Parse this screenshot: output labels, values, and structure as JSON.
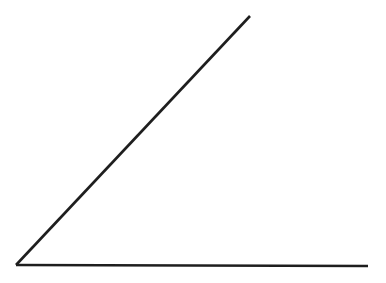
{
  "canvas": {
    "width": 386,
    "height": 283,
    "background_color": "#ffffff"
  },
  "figure": {
    "kind": "angle",
    "stroke_color": "#1e1e1e",
    "stroke_width": 2.6,
    "vertex": {
      "x": 16,
      "y": 265
    },
    "angle_degrees": 47,
    "rays": [
      {
        "name": "horizontal-ray",
        "from": {
          "x": 16,
          "y": 265
        },
        "to": {
          "x": 368,
          "y": 266
        },
        "orientation": "horizontal",
        "direction_degrees": 0
      },
      {
        "name": "diagonal-ray",
        "from": {
          "x": 16,
          "y": 265
        },
        "to": {
          "x": 250,
          "y": 16
        },
        "orientation": "diagonal",
        "direction_degrees": 47
      }
    ]
  },
  "chart_data": {
    "type": "line",
    "title": "",
    "xlabel": "",
    "ylabel": "",
    "xlim": [
      0,
      386
    ],
    "ylim": [
      0,
      283
    ],
    "grid": false,
    "legend": null,
    "series": [
      {
        "name": "horizontal-ray",
        "x": [
          16,
          368
        ],
        "y": [
          265,
          266
        ],
        "color": "#1e1e1e"
      },
      {
        "name": "diagonal-ray",
        "x": [
          16,
          250
        ],
        "y": [
          265,
          16
        ],
        "color": "#1e1e1e"
      }
    ],
    "annotations": []
  }
}
